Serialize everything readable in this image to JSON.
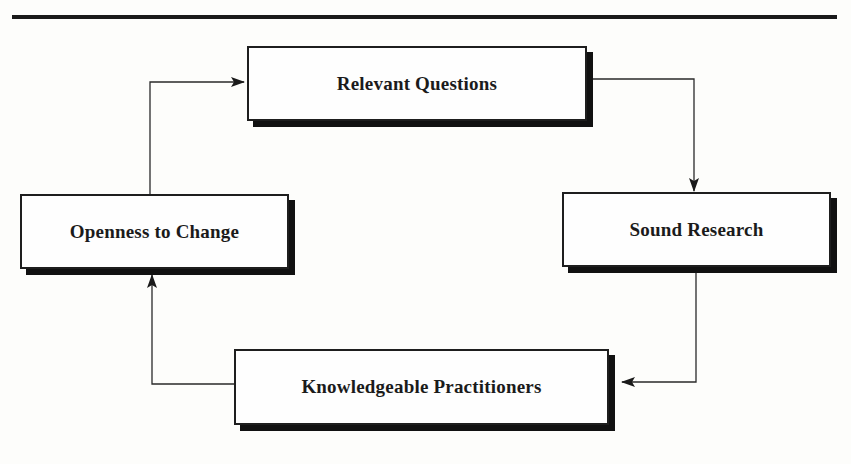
{
  "diagram": {
    "type": "cycle-flowchart",
    "nodes": [
      {
        "id": "relevant-questions",
        "label": "Relevant Questions"
      },
      {
        "id": "sound-research",
        "label": "Sound Research"
      },
      {
        "id": "knowledgeable-practitioners",
        "label": "Knowledgeable Practitioners"
      },
      {
        "id": "openness-to-change",
        "label": "Openness to Change"
      }
    ],
    "edges": [
      {
        "from": "relevant-questions",
        "to": "sound-research"
      },
      {
        "from": "sound-research",
        "to": "knowledgeable-practitioners"
      },
      {
        "from": "knowledgeable-practitioners",
        "to": "openness-to-change"
      },
      {
        "from": "openness-to-change",
        "to": "relevant-questions"
      }
    ]
  },
  "colors": {
    "ink": "#1e1e1e",
    "shadow": "#111111",
    "paper": "#fdfdfb"
  }
}
